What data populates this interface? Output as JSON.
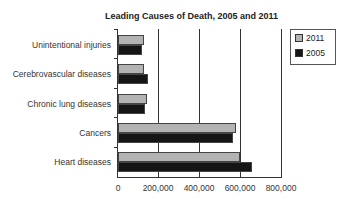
{
  "chart_data": {
    "type": "bar",
    "orientation": "horizontal",
    "title": "Leading Causes of Death, 2005 and 2011",
    "xlabel": "",
    "ylabel": "",
    "xlim": [
      0,
      800000
    ],
    "x_ticks": [
      "0",
      "200,000",
      "400,000",
      "600,000",
      "800,000"
    ],
    "categories": [
      "Unintentional injuries",
      "Cerebrovascular diseases",
      "Chronic lung diseases",
      "Cancers",
      "Heart diseases"
    ],
    "series": [
      {
        "name": "2011",
        "color": "#b3b3b3",
        "values": [
          126000,
          129000,
          143000,
          576000,
          597000
        ]
      },
      {
        "name": "2005",
        "color": "#151515",
        "values": [
          118000,
          144000,
          131000,
          560000,
          652000
        ]
      }
    ],
    "grid": "vertical gridlines",
    "legend_position": "right-top"
  },
  "legend": {
    "items": [
      {
        "label": "2011"
      },
      {
        "label": "2005"
      }
    ]
  }
}
